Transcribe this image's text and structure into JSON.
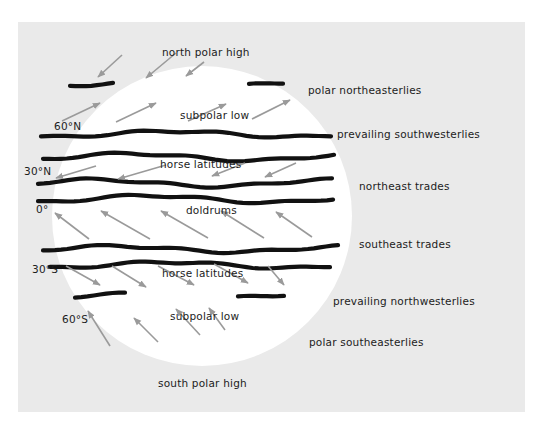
{
  "diagram": {
    "colors": {
      "background": "#ffffff",
      "panel": "#eaeaea",
      "globe": "#ffffff",
      "belt_line": "#111111",
      "wind_arrow": "#9a9a9a",
      "text": "#1c1c1c"
    },
    "latitude_labels": [
      {
        "id": "lat-60n",
        "text": "60°N"
      },
      {
        "id": "lat-30n",
        "text": "30°N"
      },
      {
        "id": "lat-0",
        "text": "0°"
      },
      {
        "id": "lat-30s",
        "text": "30°S"
      },
      {
        "id": "lat-60s",
        "text": "60°S"
      }
    ],
    "pressure_zones": [
      {
        "id": "north-polar-high",
        "text": "north polar high"
      },
      {
        "id": "subpolar-low-north",
        "text": "subpolar low"
      },
      {
        "id": "horse-latitudes-north",
        "text": "horse latitudes"
      },
      {
        "id": "doldrums",
        "text": "doldrums"
      },
      {
        "id": "horse-latitudes-south",
        "text": "horse latitudes"
      },
      {
        "id": "subpolar-low-south",
        "text": "subpolar low"
      },
      {
        "id": "south-polar-high",
        "text": "south polar high"
      }
    ],
    "wind_labels": [
      {
        "id": "polar-northeasterlies",
        "text": "polar northeasterlies",
        "direction": "from northeast"
      },
      {
        "id": "prevailing-southwesterlies",
        "text": "prevailing southwesterlies",
        "direction": "from southwest"
      },
      {
        "id": "northeast-trades",
        "text": "northeast trades",
        "direction": "from northeast"
      },
      {
        "id": "southeast-trades",
        "text": "southeast trades",
        "direction": "from southeast"
      },
      {
        "id": "prevailing-northwesterlies",
        "text": "prevailing northwesterlies",
        "direction": "from northwest"
      },
      {
        "id": "polar-southeasterlies",
        "text": "polar southeasterlies",
        "direction": "from southeast"
      }
    ]
  }
}
